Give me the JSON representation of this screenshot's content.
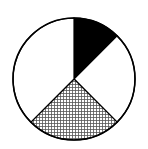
{
  "chart_data": {
    "type": "pie",
    "title": "",
    "start_angle_deg": 0,
    "direction": "clockwise",
    "center": [
      74,
      79
    ],
    "radius": 61,
    "slices": [
      {
        "name": "black",
        "value": 12.5,
        "fill": "solid",
        "color": "#000000"
      },
      {
        "name": "white-right",
        "value": 25,
        "fill": "solid",
        "color": "#ffffff"
      },
      {
        "name": "hatched",
        "value": 25,
        "fill": "crosshatch",
        "color": "#ffffff"
      },
      {
        "name": "white-left",
        "value": 37.5,
        "fill": "solid",
        "color": "#ffffff"
      }
    ],
    "values": [
      12.5,
      25,
      25,
      37.5
    ],
    "legend": [],
    "outline_color": "#000000"
  }
}
